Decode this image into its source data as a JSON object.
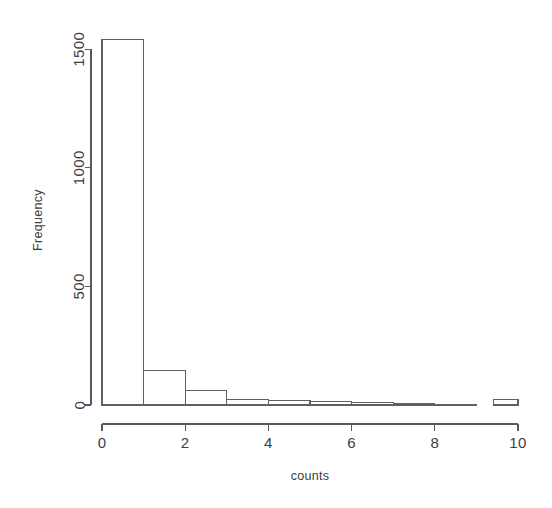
{
  "chart_data": {
    "type": "bar",
    "title": "",
    "subtitle": "",
    "xlabel": "counts",
    "ylabel": "Frequency",
    "xlim": [
      0,
      10
    ],
    "ylim": [
      0,
      1560
    ],
    "grid": false,
    "legend": null,
    "x_ticks": [
      "0",
      "2",
      "4",
      "6",
      "8",
      "10"
    ],
    "x_tick_values": [
      0,
      2,
      4,
      6,
      8,
      10
    ],
    "y_ticks": [
      "0",
      "500",
      "1000",
      "1500"
    ],
    "y_tick_values": [
      0,
      500,
      1000,
      1500
    ],
    "bin_width": 1,
    "bin_edges": [
      0,
      1,
      2,
      3,
      4,
      5,
      6,
      7,
      8,
      9,
      10
    ],
    "categories": [
      "0-1",
      "1-2",
      "2-3",
      "3-4",
      "4-5",
      "5-6",
      "6-7",
      "7-8",
      "8-9",
      "9-10"
    ],
    "values": [
      1540,
      145,
      60,
      22,
      20,
      13,
      10,
      6,
      4,
      25
    ],
    "bars": [
      {
        "label": "0-1",
        "x0": 0,
        "x1": 1,
        "value": 1540
      },
      {
        "label": "1-2",
        "x0": 1,
        "x1": 2,
        "value": 145
      },
      {
        "label": "2-3",
        "x0": 2,
        "x1": 3,
        "value": 60
      },
      {
        "label": "3-4",
        "x0": 3,
        "x1": 4,
        "value": 22
      },
      {
        "label": "4-5",
        "x0": 4,
        "x1": 5,
        "value": 20
      },
      {
        "label": "5-6",
        "x0": 5,
        "x1": 6,
        "value": 13
      },
      {
        "label": "6-7",
        "x0": 6,
        "x1": 7,
        "value": 10
      },
      {
        "label": "7-8",
        "x0": 7,
        "x1": 8,
        "value": 6
      },
      {
        "label": "8-9",
        "x0": 8,
        "x1": 9,
        "value": 4
      },
      {
        "label": "9-10",
        "x0": 9.4,
        "x1": 10,
        "value": 25
      }
    ]
  },
  "style": {
    "background_color": "#ffffff",
    "axis_color": "#595959",
    "bar_stroke_color": "#606060",
    "bar_fill_color": "#ffffff",
    "text_color": "#3d3d3d"
  },
  "geometry": {
    "plot_left": 102,
    "plot_right": 518,
    "plot_bottom": 405,
    "plot_top": 35,
    "y_axis_x": 91,
    "x_axis_y": 424
  }
}
